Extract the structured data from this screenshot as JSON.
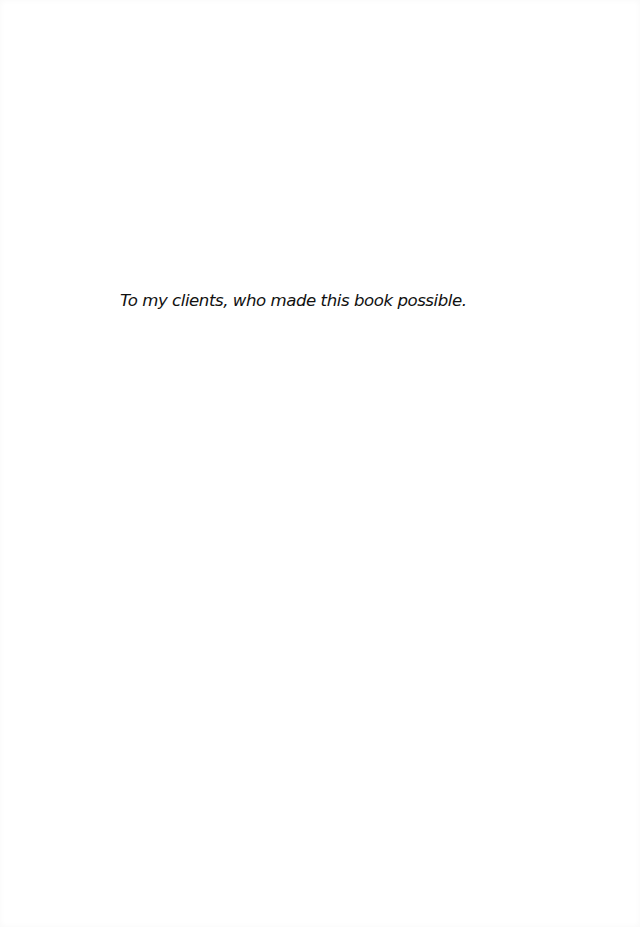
{
  "page": {
    "type": "dedication",
    "background_color": "#ffffff",
    "text_color": "#111111"
  },
  "dedication": {
    "text": "To my clients, who made this book possible."
  }
}
